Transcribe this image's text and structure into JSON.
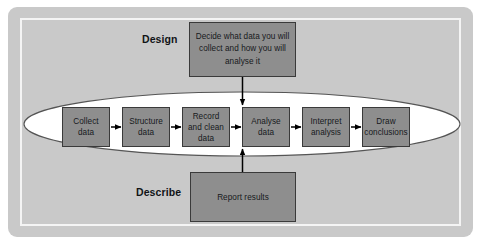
{
  "diagram": {
    "colors": {
      "panel_background": "#c9c9c9",
      "inner_frame_line": "#f4f4f4",
      "node_fill": "#8e8e8e",
      "node_border": "#3a3a3a",
      "ellipse_fill": "#ffffff",
      "ellipse_stroke": "#555555",
      "arrow": "#000000",
      "text": "#16191c"
    },
    "phases": [
      {
        "id": "design",
        "label": "Design"
      },
      {
        "id": "describe",
        "label": "Describe"
      }
    ],
    "notes": [
      {
        "id": "design-note",
        "text": "Decide what data you will collect and how you will analyse it",
        "connects_to": "record-and-clean-data",
        "arrow_direction": "down"
      },
      {
        "id": "describe-note",
        "text": "Report results",
        "connects_to": "record-and-clean-data",
        "arrow_direction": "up"
      }
    ],
    "process_steps": [
      {
        "id": "collect-data",
        "label": "Collect data"
      },
      {
        "id": "structure-data",
        "label": "Structure data"
      },
      {
        "id": "record-and-clean-data",
        "label": "Record and clean data"
      },
      {
        "id": "analyse-data",
        "label": "Analyse data"
      },
      {
        "id": "interpret-analysis",
        "label": "Interpret analysis"
      },
      {
        "id": "draw-conclusions",
        "label": "Draw conclusions"
      }
    ]
  }
}
